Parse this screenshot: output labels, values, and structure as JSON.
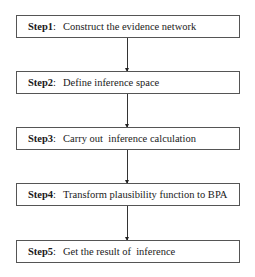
{
  "diagram": {
    "type": "flowchart",
    "direction": "top-to-bottom",
    "steps": [
      {
        "label": "Step1",
        "text": "Construct the evidence network"
      },
      {
        "label": "Step2",
        "text": "Define inference space"
      },
      {
        "label": "Step3",
        "text": "Carry out  inference calculation"
      },
      {
        "label": "Step4",
        "text": "Transform plausibility function to BPA"
      },
      {
        "label": "Step5",
        "text": "Get the result of  inference"
      }
    ],
    "separator": ":",
    "edges": [
      {
        "from": "Step1",
        "to": "Step2"
      },
      {
        "from": "Step2",
        "to": "Step3"
      },
      {
        "from": "Step3",
        "to": "Step4"
      },
      {
        "from": "Step4",
        "to": "Step5"
      }
    ]
  }
}
